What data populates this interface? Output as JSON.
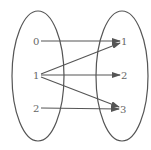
{
  "diagram": {
    "type": "mapping",
    "domain_set": {
      "elements": [
        "0",
        "1",
        "2"
      ]
    },
    "codomain_set": {
      "elements": [
        "1",
        "2",
        "3"
      ]
    },
    "mappings": [
      {
        "from": "0",
        "to": "1"
      },
      {
        "from": "1",
        "to": "1"
      },
      {
        "from": "1",
        "to": "2"
      },
      {
        "from": "1",
        "to": "3"
      },
      {
        "from": "2",
        "to": "3"
      }
    ],
    "colors": {
      "stroke": "#555555",
      "text": "#666666",
      "background": "#ffffff"
    }
  }
}
